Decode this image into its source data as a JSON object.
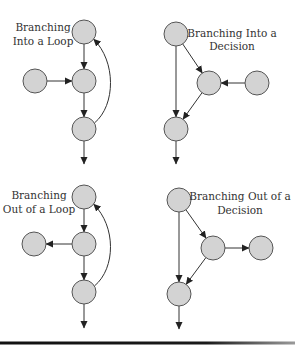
{
  "colors": {
    "node_fill": "#d3d3d3",
    "node_stroke": "#555555",
    "edge": "#333333",
    "text": "#333333",
    "rule": "#111111"
  },
  "panels": [
    {
      "id": "branching-into-a-loop",
      "title_lines": [
        "Branching",
        "Into a Loop"
      ],
      "title_pos": [
        [
          43,
          31
        ],
        [
          43,
          45
        ]
      ],
      "nodes": [
        {
          "id": "a",
          "cx": 84,
          "cy": 32
        },
        {
          "id": "b",
          "cx": 35,
          "cy": 81
        },
        {
          "id": "c",
          "cx": 84,
          "cy": 81
        },
        {
          "id": "d",
          "cx": 84,
          "cy": 129
        }
      ],
      "edges": [
        {
          "from": "a",
          "to": "c",
          "type": "straight"
        },
        {
          "from": "b",
          "to": "c",
          "type": "straight"
        },
        {
          "from": "c",
          "to": "d",
          "type": "straight"
        },
        {
          "from": "d",
          "to": "a",
          "type": "curve"
        },
        {
          "from": "d",
          "to": "exit",
          "type": "exit",
          "end": [
            84,
            164
          ]
        }
      ]
    },
    {
      "id": "branching-into-a-decision",
      "title_lines": [
        "Branching Into a",
        "Decision"
      ],
      "title_pos": [
        [
          232,
          37
        ],
        [
          232,
          50
        ]
      ],
      "nodes": [
        {
          "id": "a",
          "cx": 176,
          "cy": 34
        },
        {
          "id": "b",
          "cx": 209,
          "cy": 83
        },
        {
          "id": "c",
          "cx": 257,
          "cy": 83
        },
        {
          "id": "d",
          "cx": 176,
          "cy": 129
        }
      ],
      "edges": [
        {
          "from": "a",
          "to": "b",
          "type": "straight"
        },
        {
          "from": "c",
          "to": "b",
          "type": "straight"
        },
        {
          "from": "a",
          "to": "d",
          "type": "straight"
        },
        {
          "from": "b",
          "to": "d",
          "type": "straight"
        },
        {
          "from": "d",
          "to": "exit",
          "type": "exit",
          "end": [
            176,
            164
          ]
        }
      ]
    },
    {
      "id": "branching-out-of-a-loop",
      "title_lines": [
        "Branching",
        "Out of a Loop"
      ],
      "title_pos": [
        [
          39,
          199
        ],
        [
          39,
          213
        ]
      ],
      "nodes": [
        {
          "id": "a",
          "cx": 84,
          "cy": 197
        },
        {
          "id": "b",
          "cx": 34,
          "cy": 244
        },
        {
          "id": "c",
          "cx": 84,
          "cy": 244
        },
        {
          "id": "d",
          "cx": 84,
          "cy": 292
        }
      ],
      "edges": [
        {
          "from": "a",
          "to": "c",
          "type": "straight"
        },
        {
          "from": "c",
          "to": "b",
          "type": "straight"
        },
        {
          "from": "c",
          "to": "d",
          "type": "straight"
        },
        {
          "from": "d",
          "to": "a",
          "type": "curve"
        },
        {
          "from": "d",
          "to": "exit",
          "type": "exit",
          "end": [
            84,
            328
          ]
        }
      ]
    },
    {
      "id": "branching-out-of-a-decision",
      "title_lines": [
        "Branching Out of a",
        "Decision"
      ],
      "title_pos": [
        [
          240,
          200
        ],
        [
          240,
          214
        ]
      ],
      "nodes": [
        {
          "id": "a",
          "cx": 179,
          "cy": 200
        },
        {
          "id": "b",
          "cx": 213,
          "cy": 248
        },
        {
          "id": "c",
          "cx": 261,
          "cy": 248
        },
        {
          "id": "d",
          "cx": 179,
          "cy": 294
        }
      ],
      "edges": [
        {
          "from": "a",
          "to": "b",
          "type": "straight"
        },
        {
          "from": "b",
          "to": "c",
          "type": "straight"
        },
        {
          "from": "a",
          "to": "d",
          "type": "straight"
        },
        {
          "from": "b",
          "to": "d",
          "type": "straight"
        },
        {
          "from": "d",
          "to": "exit",
          "type": "exit",
          "end": [
            179,
            329
          ]
        }
      ]
    }
  ],
  "node_radius": 12,
  "bottom_rule": {
    "y": 343,
    "x1": 0,
    "x2": 295,
    "thickness": 3
  }
}
